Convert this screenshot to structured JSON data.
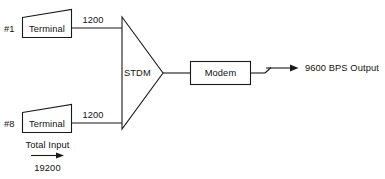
{
  "diagram": {
    "colors": {
      "stroke": "#1a1a1a",
      "background": "#ffffff",
      "text": "#121212"
    },
    "terminals": [
      {
        "id_label": "#1",
        "body_label": "Terminal",
        "line_rate_label": "1200"
      },
      {
        "id_label": "#8",
        "body_label": "Terminal",
        "line_rate_label": "1200"
      }
    ],
    "multiplexer": {
      "label": "STDM",
      "shape": "triangle-right"
    },
    "modem": {
      "label": "Modem",
      "shape": "rectangle"
    },
    "output": {
      "label": "9600 BPS Output"
    },
    "total_input": {
      "caption": "Total Input",
      "value": "19200",
      "arrow": "right-arrow-icon"
    }
  }
}
